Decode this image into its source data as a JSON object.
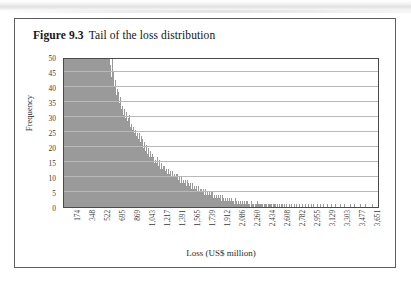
{
  "figure": {
    "label": "Figure 9.3",
    "title": "Tail of the loss distribution"
  },
  "chart_data": {
    "type": "bar",
    "title": "Tail of the loss distribution",
    "xlabel": "Loss (US$ million)",
    "ylabel": "Frequency",
    "ylim": [
      0,
      50
    ],
    "ytick_step": 5,
    "yticks": [
      0,
      5,
      10,
      15,
      20,
      25,
      30,
      35,
      40,
      45,
      50
    ],
    "grid": true,
    "legend": "none",
    "bar_color": "#9a9a9a",
    "note": "Histogram of simulated losses; leftmost bins are clipped at the 50 axis maximum.",
    "xticks": [
      "174",
      "348",
      "522",
      "695",
      "869",
      "1,043",
      "1,217",
      "1,391",
      "1,565",
      "1,739",
      "1,912",
      "2,086",
      "2,260",
      "2,434",
      "2,608",
      "2,782",
      "2,955",
      "3,129",
      "3,303",
      "3,477",
      "3,651"
    ],
    "x_tick_values": [
      174,
      348,
      522,
      695,
      869,
      1043,
      1217,
      1391,
      1565,
      1739,
      1912,
      2086,
      2260,
      2434,
      2608,
      2782,
      2955,
      3129,
      3303,
      3477,
      3651
    ],
    "values": [
      50,
      50,
      50,
      50,
      50,
      50,
      50,
      50,
      50,
      50,
      50,
      50,
      50,
      50,
      50,
      50,
      50,
      50,
      50,
      50,
      50,
      50,
      50,
      50,
      50,
      50,
      50,
      50,
      50,
      50,
      50,
      50,
      50,
      50,
      50,
      50,
      50,
      50,
      50,
      50,
      50,
      50,
      50,
      50,
      50,
      50,
      50,
      50,
      50,
      50,
      48,
      44,
      50,
      46,
      41,
      43,
      38,
      40,
      36,
      39,
      35,
      37,
      33,
      34,
      31,
      33,
      30,
      32,
      29,
      30,
      28,
      31,
      27,
      28,
      26,
      27,
      25,
      26,
      24,
      25,
      23,
      25,
      22,
      24,
      21,
      23,
      20,
      22,
      19,
      21,
      18,
      20,
      17,
      19,
      17,
      18,
      16,
      17,
      15,
      16,
      15,
      17,
      14,
      16,
      13,
      15,
      13,
      14,
      12,
      14,
      12,
      13,
      11,
      13,
      11,
      12,
      10,
      12,
      10,
      11,
      10,
      11,
      9,
      11,
      9,
      10,
      8,
      10,
      8,
      9,
      8,
      9,
      7,
      9,
      7,
      8,
      7,
      8,
      6,
      8,
      6,
      7,
      6,
      7,
      5,
      7,
      5,
      6,
      5,
      6,
      5,
      6,
      4,
      6,
      4,
      5,
      4,
      5,
      4,
      5,
      3,
      5,
      3,
      4,
      3,
      4,
      3,
      4,
      3,
      4,
      2,
      4,
      2,
      3,
      2,
      3,
      2,
      3,
      2,
      3,
      2,
      3,
      2,
      2,
      1,
      3,
      1,
      2,
      1,
      2,
      1,
      2,
      1,
      2,
      1,
      2,
      1,
      2,
      1,
      2,
      1,
      1,
      0,
      2,
      1,
      1,
      0,
      1,
      1,
      2,
      1,
      1,
      0,
      1,
      1,
      1,
      0,
      1,
      1,
      1,
      0,
      1,
      1,
      1,
      0,
      1,
      0,
      1,
      1,
      1,
      0,
      1,
      0,
      1,
      0,
      1,
      1,
      0,
      0,
      1,
      0,
      1,
      0,
      0,
      1,
      0,
      1,
      0,
      0,
      1,
      0,
      0,
      1,
      0,
      0,
      1,
      0,
      0,
      1,
      0,
      0,
      1,
      0,
      0,
      0,
      1,
      0,
      0,
      1,
      0,
      1,
      0,
      0,
      0,
      1,
      0,
      0,
      0,
      1,
      0,
      0,
      1,
      0,
      0,
      0,
      1,
      0,
      0,
      0,
      0,
      1,
      0,
      0,
      0,
      1,
      0,
      0,
      0,
      0,
      1,
      0,
      0,
      0,
      0,
      1,
      0,
      0,
      0,
      0,
      0,
      1,
      0,
      0,
      0,
      0,
      1,
      0,
      0,
      0,
      0,
      0,
      1,
      0,
      0,
      0,
      0,
      0,
      1,
      0,
      0,
      0,
      0,
      0,
      0,
      1,
      0,
      0,
      0,
      0,
      0
    ]
  }
}
